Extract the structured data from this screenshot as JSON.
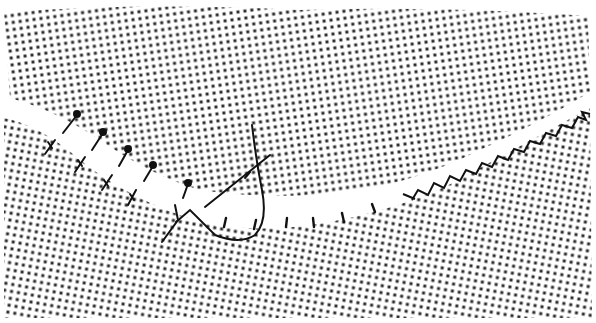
{
  "figure": {
    "background_color": "#ffffff",
    "tissue_dot_color": "#2a2a2a",
    "suture_color": "#111111",
    "wound_color": "#ffffff"
  },
  "elements": {
    "tissue": "dotted-halftone-tissue",
    "wound": "curved-incision",
    "sutures": [
      "interrupted-sutures-left",
      "needle-and-thread-loop",
      "small-stitch-marks-center",
      "continuous-zigzag-suture-right"
    ]
  }
}
